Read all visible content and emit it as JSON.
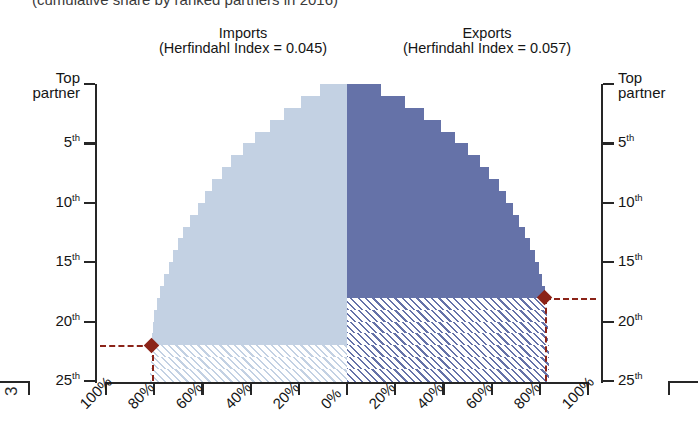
{
  "caption": {
    "text": "(cumulative share by ranked partners in 2016)"
  },
  "page_number": "3",
  "headers": {
    "imports": {
      "title": "Imports",
      "subtitle": "(Herfindahl Index = 0.045)"
    },
    "exports": {
      "title": "Exports",
      "subtitle": "(Herfindahl Index = 0.057)"
    }
  },
  "colors": {
    "imports": "#c3d1e3",
    "exports": "#6572a8",
    "marker": "#8b2318",
    "axis": "#262626"
  },
  "axes": {
    "y_labels_top": "Top partner",
    "y_ticks": [
      "Top partner",
      "5th",
      "10th",
      "15th",
      "20th",
      "25th"
    ],
    "y_tick_values": [
      1,
      5,
      10,
      15,
      20,
      25
    ],
    "x_labels_left": [
      "100%",
      "80%",
      "60%",
      "40%",
      "20%",
      "0%"
    ],
    "x_labels_right": [
      "0%",
      "20%",
      "40%",
      "60%",
      "80%",
      "100%"
    ]
  },
  "markers": {
    "imports": {
      "partner_rank": "22nd",
      "cumulative_share": "81%"
    },
    "exports": {
      "partner_rank": "18th",
      "cumulative_share": "82%"
    }
  },
  "chart_data": {
    "type": "bar",
    "title": "(cumulative share by ranked partners in 2016)",
    "xlabel": "",
    "ylabel": "Partner rank",
    "orientation": "horizontal-mirrored",
    "grid": false,
    "legend": "none",
    "ylim": [
      1,
      25
    ],
    "xlim": [
      0,
      100
    ],
    "categories": [
      1,
      2,
      3,
      4,
      5,
      6,
      7,
      8,
      9,
      10,
      11,
      12,
      13,
      14,
      15,
      16,
      17,
      18,
      19,
      20,
      21,
      22,
      23,
      24,
      25
    ],
    "series": [
      {
        "name": "Imports",
        "herfindahl_index": 0.045,
        "direction": "left",
        "color": "#c3d1e3",
        "threshold_rank": 22,
        "threshold_share": 81,
        "values": [
          11,
          19,
          26,
          32,
          38,
          43,
          48,
          52,
          56,
          59,
          62,
          65,
          68,
          70,
          72,
          74,
          76,
          77.5,
          79,
          80,
          80.6,
          81,
          81.3,
          81.5,
          81.6
        ]
      },
      {
        "name": "Exports",
        "herfindahl_index": 0.057,
        "direction": "right",
        "color": "#6572a8",
        "threshold_rank": 18,
        "threshold_share": 82,
        "values": [
          14,
          24,
          32,
          39,
          45,
          50,
          55,
          59,
          63,
          66,
          69,
          71.5,
          74,
          76,
          78,
          79.5,
          81,
          82,
          82.6,
          83,
          83.3,
          83.5,
          83.7,
          83.8,
          83.9
        ]
      }
    ]
  }
}
